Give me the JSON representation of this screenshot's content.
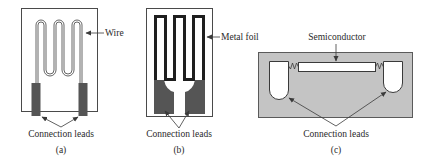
{
  "panels": [
    {
      "id": "a",
      "caption": "(a)",
      "callout": "Wire",
      "leads_label": "Connection leads"
    },
    {
      "id": "b",
      "caption": "(b)",
      "callout": "Metal foil",
      "leads_label": "Connection leads"
    },
    {
      "id": "c",
      "caption": "(c)",
      "callout": "Semiconductor",
      "leads_label": "Connection leads"
    }
  ],
  "colors": {
    "line": "#4a4a4a",
    "lead_fill": "#555555",
    "substrate_fill": "#c4c4c4",
    "background": "#ffffff"
  }
}
